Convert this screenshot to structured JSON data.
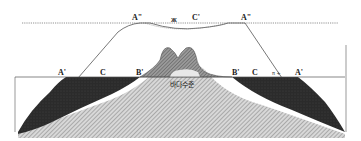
{
  "diagram": {
    "type": "cross-section",
    "labels": {
      "a_double_left": "A\"",
      "a_double_right": "A\"",
      "c_prime": "C'",
      "c_prime_marker": "ж",
      "a_prime_left": "A'",
      "a_prime_right": "A'",
      "b_prime_left": "B'",
      "b_prime_right": "B'",
      "c_left": "C",
      "c_right": "C",
      "small_marks_left": "ᵥ",
      "small_marks_right": "π +",
      "sea_level": "바다수준"
    },
    "colors": {
      "background": "#ffffff",
      "line": "#444444",
      "reef_dark": "#2a2a2a",
      "island_hatch": "#7a7a7a",
      "bedrock_hatch": "#b0b0b0"
    }
  }
}
